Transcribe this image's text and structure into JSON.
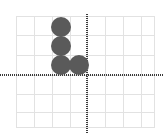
{
  "figure": {
    "title": "",
    "background_color": "#ffffff",
    "width": 163,
    "height": 134
  },
  "chart_data": {
    "type": "scatter",
    "title": "",
    "subtitle": "",
    "xlabel": "",
    "ylabel": "",
    "grid": true,
    "legend": null,
    "axis_style": "dotted",
    "axis_color": "#3b3b3b",
    "grid_color": "#e2e2e2",
    "marker_color": "#5a5a5a",
    "marker_shape": "circle",
    "marker_size_px": 20,
    "origin_px": {
      "x": 87,
      "y": 75
    },
    "cell_size_px": 18,
    "xlim": [
      -4,
      3.8
    ],
    "ylim": [
      -2.9,
      3.3
    ],
    "xticks": [
      -4,
      -3,
      -2,
      -1,
      0,
      1,
      2,
      3
    ],
    "yticks": [
      -2,
      -1,
      0,
      1,
      2,
      3
    ],
    "x": [
      -1.5,
      -1.5,
      -1.5,
      -0.5
    ],
    "y": [
      2.6,
      1.6,
      0.55,
      0.55
    ],
    "points": [
      {
        "x": -1.5,
        "y": 2.6,
        "px": 61,
        "py": 27
      },
      {
        "x": -1.5,
        "y": 1.6,
        "px": 61,
        "py": 46
      },
      {
        "x": -1.5,
        "y": 0.55,
        "px": 61,
        "py": 65
      },
      {
        "x": -0.5,
        "y": 0.55,
        "px": 79,
        "py": 65
      }
    ],
    "grid_lines_v_px": [
      16,
      34,
      52,
      70,
      87,
      105,
      123,
      141,
      155
    ],
    "grid_lines_h_px": [
      16,
      35,
      55,
      75,
      94,
      112,
      128
    ]
  }
}
